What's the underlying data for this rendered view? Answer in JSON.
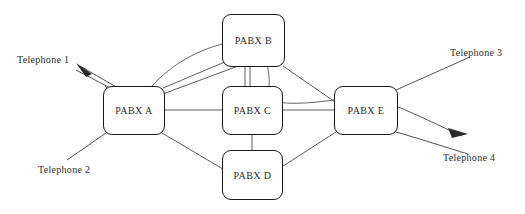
{
  "diagram": {
    "type": "node-link-diagram",
    "canvas": {
      "width": 525,
      "height": 214,
      "background": "#ffffff"
    },
    "style": {
      "line_color": "#4a4a4a",
      "node_border_color": "#1a1a1a",
      "node_fill": "#ffffff",
      "text_color": "#2b2b2b"
    },
    "nodes": [
      {
        "id": "A",
        "label": "PABX A",
        "x": 103,
        "y": 86,
        "width": 62,
        "height": 49
      },
      {
        "id": "B",
        "label": "PABX B",
        "x": 222,
        "y": 14,
        "width": 63,
        "height": 53
      },
      {
        "id": "C",
        "label": "PABX C",
        "x": 222,
        "y": 86,
        "width": 61,
        "height": 49
      },
      {
        "id": "D",
        "label": "PABX D",
        "x": 222,
        "y": 150,
        "width": 61,
        "height": 50
      },
      {
        "id": "E",
        "label": "PABX E",
        "x": 334,
        "y": 86,
        "width": 64,
        "height": 49
      }
    ],
    "endpoints": [
      {
        "id": "T1",
        "label": "Telephone 1",
        "x": 17,
        "y": 54,
        "has_arrow": true,
        "arrow_direction": "up-left"
      },
      {
        "id": "T2",
        "label": "Telephone 2",
        "x": 38,
        "y": 164,
        "has_arrow": false
      },
      {
        "id": "T3",
        "label": "Telephone 3",
        "x": 450,
        "y": 47,
        "has_arrow": false
      },
      {
        "id": "T4",
        "label": "Telephone 4",
        "x": 443,
        "y": 152,
        "has_arrow": true,
        "arrow_direction": "right-down"
      }
    ],
    "links": [
      {
        "from": "A",
        "to": "B",
        "kind": "straight"
      },
      {
        "from": "A",
        "to": "B",
        "kind": "curve"
      },
      {
        "from": "A",
        "to": "C",
        "kind": "straight"
      },
      {
        "from": "A",
        "to": "D",
        "kind": "straight"
      },
      {
        "from": "B",
        "to": "C",
        "kind": "straight"
      },
      {
        "from": "B",
        "to": "E",
        "kind": "straight"
      },
      {
        "from": "B",
        "to": "E",
        "kind": "curve"
      },
      {
        "from": "C",
        "to": "D",
        "kind": "straight"
      },
      {
        "from": "C",
        "to": "E",
        "kind": "straight"
      },
      {
        "from": "D",
        "to": "E",
        "kind": "straight"
      },
      {
        "from": "A",
        "to": "T1",
        "kind": "trunk"
      },
      {
        "from": "A",
        "to": "T2",
        "kind": "trunk"
      },
      {
        "from": "E",
        "to": "T3",
        "kind": "trunk"
      },
      {
        "from": "E",
        "to": "T4",
        "kind": "trunk"
      }
    ]
  }
}
